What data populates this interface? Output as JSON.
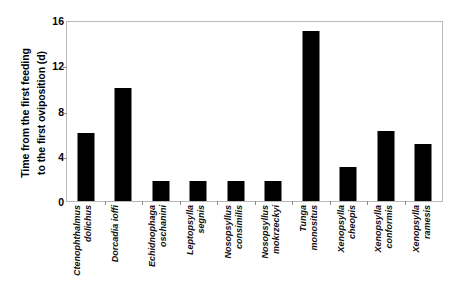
{
  "chart_data": {
    "type": "bar",
    "title": "",
    "xlabel": "",
    "ylabel": "Time from the first feeding to the first oviposition (d)",
    "ylabel_lines": [
      "Time from the first feeding",
      "to the first oviposition (d)"
    ],
    "ylim": [
      0,
      16
    ],
    "yticks": [
      0,
      4,
      8,
      12,
      16
    ],
    "ytick_labels": [
      "0",
      "4",
      "8",
      "12",
      "16"
    ],
    "grid": false,
    "legend": null,
    "categories": [
      "Ctenophthalmus dolichus",
      "Dorcadia ioffi",
      "Echidnophaga oschanini",
      "Leptopsylla segnis",
      "Nosopsyllus consimilis",
      "Nosopsyllus mokrzeckyi",
      "Tunga monositus",
      "Xenopsylla cheopis",
      "Xenopsylla conformis",
      "Xenopsylla ramesis"
    ],
    "category_lines": [
      [
        "Ctenophthalmus",
        "dolichus"
      ],
      [
        "Dorcadia ioffi"
      ],
      [
        "Echidnophaga",
        "oschanini"
      ],
      [
        "Leptopsylla",
        "segnis"
      ],
      [
        "Nosopsyllus",
        "consimilis"
      ],
      [
        "Nosopsyllus",
        "mokrzeckyi"
      ],
      [
        "Tunga",
        "monositus"
      ],
      [
        "Xenopsylla",
        "cheopis"
      ],
      [
        "Xenopsylla",
        "conformis"
      ],
      [
        "Xenopsylla",
        "ramesis"
      ]
    ],
    "values": [
      6,
      10,
      1.8,
      1.8,
      1.8,
      1.8,
      15,
      3,
      6.2,
      5
    ],
    "bar_color": "#000000",
    "frame_color": "#b9b9b9"
  }
}
